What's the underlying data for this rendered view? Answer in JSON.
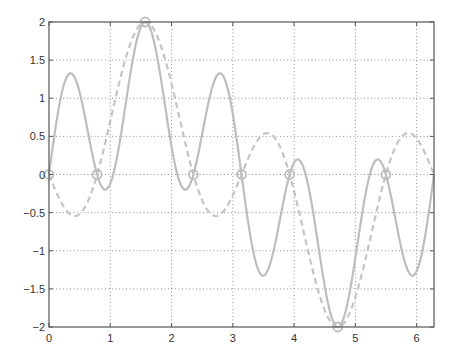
{
  "chart_data": {
    "type": "line",
    "title": "",
    "xlabel": "",
    "ylabel": "",
    "xlim": [
      0,
      6.2832
    ],
    "ylim": [
      -2,
      2
    ],
    "grid": true,
    "legend": null,
    "x_ticks": [
      0,
      1,
      2,
      3,
      4,
      5,
      6
    ],
    "x_tick_labels": [
      "0",
      "1",
      "2",
      "3",
      "4",
      "5",
      "6"
    ],
    "y_ticks": [
      2,
      1.5,
      1,
      0.5,
      0,
      -0.5,
      -1,
      -1.5,
      -2
    ],
    "y_tick_labels": [
      "2",
      "1.5",
      "1",
      "0.5",
      "0",
      "−0.5",
      "−1",
      "−1.5",
      "−2"
    ],
    "series": [
      {
        "name": "sin(x)+sin(5x)",
        "style": "solid",
        "color": "#bdbdbd",
        "expr": "sin5",
        "x": [
          0,
          0.33,
          0.785,
          0.95,
          1.571,
          2.19,
          2.356,
          2.81,
          3.142,
          3.47,
          3.927,
          4.09,
          4.712,
          5.33,
          5.498,
          5.95,
          6.283
        ],
        "values": [
          0,
          1.32,
          0,
          -0.19,
          2,
          -0.19,
          0,
          1.32,
          0,
          -1.32,
          0,
          0.19,
          -2,
          0.19,
          0,
          -1.32,
          0
        ]
      },
      {
        "name": "sin(x)-sin(3x)",
        "style": "dashed",
        "color": "#c4c4c4",
        "expr": "sin3",
        "x": [
          0,
          0.4,
          0.785,
          1.571,
          2.356,
          2.74,
          3.142,
          3.54,
          3.927,
          4.712,
          5.498,
          5.88,
          6.283
        ],
        "values": [
          0,
          -0.54,
          0,
          2,
          0,
          -0.54,
          0,
          0.54,
          0,
          -2,
          0,
          0.54,
          0
        ]
      }
    ],
    "markers": {
      "shape": "circle",
      "color": "#bdbdbd",
      "x": [
        0,
        0.785,
        1.571,
        2.356,
        3.142,
        3.927,
        4.712,
        5.498
      ],
      "values": [
        0,
        0,
        2,
        0,
        0,
        0,
        -2,
        0
      ]
    }
  }
}
